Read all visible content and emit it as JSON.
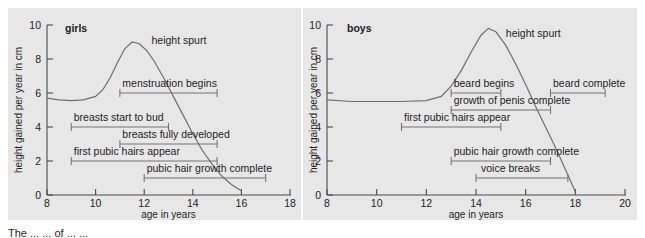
{
  "figure": {
    "background_color": "#e7e7e7",
    "axis_color": "#4a4a4a",
    "curve_color": "#6f6f6f",
    "bar_color": "#757575",
    "caption_fragment": "The ... ... of ... ..."
  },
  "chart_data": [
    {
      "type": "line",
      "title": "girls",
      "xlabel": "age in years",
      "ylabel": "height gained per year in cm",
      "xlim": [
        8,
        18
      ],
      "ylim": [
        0,
        10
      ],
      "xticks": [
        8,
        10,
        12,
        14,
        16,
        18
      ],
      "yticks": [
        0,
        2,
        4,
        6,
        8,
        10
      ],
      "grid": false,
      "legend": "none",
      "series": [
        {
          "name": "height spurt",
          "label": "height spurt",
          "label_x": 12.3,
          "label_y": 8.9,
          "x": [
            8.0,
            8.5,
            9.0,
            9.5,
            10.0,
            10.3,
            10.6,
            10.9,
            11.2,
            11.5,
            11.8,
            12.1,
            12.4,
            12.8,
            13.2,
            13.6,
            14.0,
            14.4,
            14.8,
            15.2,
            15.6,
            16.0
          ],
          "y": [
            5.7,
            5.6,
            5.55,
            5.6,
            5.8,
            6.2,
            6.9,
            7.8,
            8.6,
            9.0,
            8.9,
            8.5,
            7.9,
            6.9,
            5.8,
            4.7,
            3.6,
            2.6,
            1.8,
            1.1,
            0.6,
            0.25
          ]
        }
      ],
      "annotations": [
        {
          "label": "menstruation begins",
          "y": 6,
          "x_start": 11.0,
          "x_end": 15.0,
          "label_x": 11.1,
          "label_align": "start"
        },
        {
          "label": "breasts start to bud",
          "y": 4,
          "x_start": 9.0,
          "x_end": 13.0,
          "label_x": 9.1,
          "label_align": "start"
        },
        {
          "label": "breasts fully developed",
          "y": 3,
          "x_start": 11.0,
          "x_end": 15.0,
          "label_x": 11.1,
          "label_align": "start"
        },
        {
          "label": "first pubic hairs appear",
          "y": 2,
          "x_start": 9.0,
          "x_end": 15.0,
          "label_x": 9.1,
          "label_align": "start"
        },
        {
          "label": "pubic hair growth complete",
          "y": 1,
          "x_start": 12.0,
          "x_end": 17.0,
          "label_x": 12.1,
          "label_align": "start"
        }
      ]
    },
    {
      "type": "line",
      "title": "boys",
      "xlabel": "age in years",
      "ylabel": "height gained per year in cm",
      "xlim": [
        8,
        20
      ],
      "ylim": [
        0,
        10
      ],
      "xticks": [
        8,
        10,
        12,
        14,
        16,
        18,
        20
      ],
      "yticks": [
        0,
        2,
        4,
        6,
        8,
        10
      ],
      "grid": false,
      "legend": "none",
      "series": [
        {
          "name": "height spurt",
          "label": "height spurt",
          "label_x": 15.2,
          "label_y": 9.3,
          "x": [
            8.0,
            9.0,
            10.0,
            11.0,
            12.0,
            12.6,
            13.0,
            13.4,
            13.8,
            14.2,
            14.5,
            14.8,
            15.2,
            15.6,
            16.0,
            16.4,
            16.8,
            17.2,
            17.6,
            18.0
          ],
          "y": [
            5.6,
            5.5,
            5.5,
            5.5,
            5.55,
            5.8,
            6.4,
            7.3,
            8.4,
            9.4,
            9.8,
            9.6,
            8.8,
            7.7,
            6.5,
            5.2,
            4.0,
            2.8,
            1.5,
            0.2
          ]
        }
      ],
      "annotations": [
        {
          "label": "beard begins",
          "y": 6,
          "x_start": 13.0,
          "x_end": 15.0,
          "label_x": 13.1,
          "label_align": "start"
        },
        {
          "label": "beard complete",
          "y": 6,
          "x_start": 17.0,
          "x_end": 19.2,
          "label_x": 17.1,
          "label_align": "start"
        },
        {
          "label": "growth of penis complete",
          "y": 5,
          "x_start": 13.0,
          "x_end": 17.0,
          "label_x": 13.1,
          "label_align": "start"
        },
        {
          "label": "first pubic hairs appear",
          "y": 4,
          "x_start": 11.0,
          "x_end": 15.0,
          "label_x": 11.1,
          "label_align": "start"
        },
        {
          "label": "pubic hair growth complete",
          "y": 2,
          "x_start": 13.0,
          "x_end": 17.0,
          "label_x": 13.1,
          "label_align": "start"
        },
        {
          "label": "voice breaks",
          "y": 1,
          "x_start": 14.0,
          "x_end": 17.7,
          "label_x": 14.2,
          "label_align": "start"
        }
      ]
    }
  ]
}
